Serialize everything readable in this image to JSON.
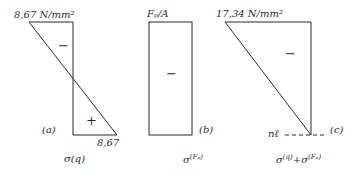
{
  "diagrams": [
    {
      "id": "a",
      "top_label": "8,67 N/mm²",
      "bottom_value": "8,67",
      "sign_top": "−",
      "sign_bottom": "+",
      "tag": "(a)",
      "caption_base": "σ",
      "caption_sup": "(q)"
    },
    {
      "id": "b",
      "top_label": "Fₚ/A",
      "sign": "−",
      "tag": "(b)",
      "caption_base": "σ",
      "caption_sup": "(Fₚ)"
    },
    {
      "id": "c",
      "top_label": "17,34 N/mm²",
      "sign": "−",
      "neutral_line": "nℓ",
      "tag": "(c)",
      "caption_base1": "σ",
      "caption_sup1": "(q)",
      "caption_plus": "+",
      "caption_base2": "σ",
      "caption_sup2": "(Fₚ)"
    }
  ],
  "colors": {
    "stroke": "#2a2a2a",
    "background": "#ffffff"
  }
}
